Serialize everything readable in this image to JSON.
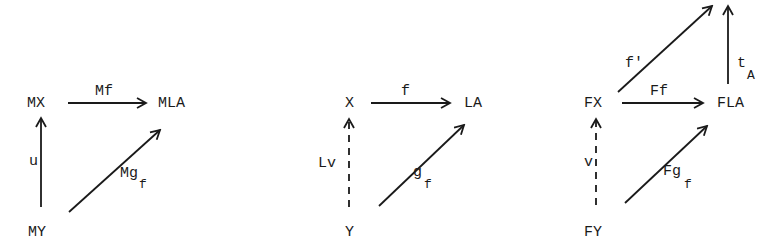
{
  "diagrams": [
    {
      "id": "M-diagram",
      "objects": {
        "top_left": "MX",
        "top_right": "MLA",
        "bottom_left": "MY"
      },
      "arrows": {
        "top": {
          "label": "Mf",
          "style": "solid"
        },
        "left": {
          "label": "u",
          "style": "solid"
        },
        "diagonal": {
          "label_main": "Mg",
          "label_sub": "f",
          "style": "solid"
        }
      }
    },
    {
      "id": "base-diagram",
      "objects": {
        "top_left": "X",
        "top_right": "LA",
        "bottom_left": "Y"
      },
      "arrows": {
        "top": {
          "label": "f",
          "style": "solid"
        },
        "left": {
          "label": "Lv",
          "style": "dashed"
        },
        "diagonal": {
          "label_main": "g",
          "label_sub": "f",
          "style": "solid"
        }
      }
    },
    {
      "id": "F-diagram",
      "objects": {
        "top_left": "FX",
        "top_right": "FLA",
        "bottom_left": "FY"
      },
      "arrows": {
        "top": {
          "label": "Ff",
          "style": "solid"
        },
        "left": {
          "label": "v",
          "style": "dashed"
        },
        "diagonal": {
          "label_main": "Fg",
          "label_sub": "f",
          "style": "solid"
        },
        "upper_diagonal": {
          "label": "f'",
          "style": "solid"
        },
        "upper_vertical": {
          "label_main": "t",
          "label_sub": "A",
          "style": "solid"
        }
      }
    }
  ],
  "colors": {
    "ink": "#1a1a1a",
    "paper": "#ffffff"
  }
}
